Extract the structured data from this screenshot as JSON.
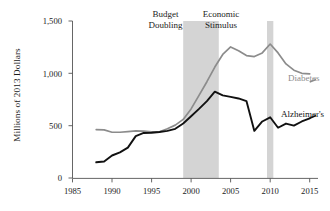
{
  "chart_data": {
    "type": "line",
    "title": "",
    "xlabel": "",
    "ylabel": "Millions of 2013 Dollars",
    "xlim": [
      1985,
      2016
    ],
    "ylim": [
      0,
      1500
    ],
    "grid": false,
    "legend_position": "right-inline-labels",
    "xticks": [
      1985,
      1990,
      1995,
      2000,
      2005,
      2010,
      2015
    ],
    "xtick_labels": [
      "1985",
      "1990",
      "1995",
      "2000",
      "2005",
      "2010",
      "2015"
    ],
    "yticks": [
      0,
      500,
      1000,
      1500
    ],
    "ytick_labels": [
      "0",
      "500",
      "1,000",
      "1,500"
    ],
    "series": [
      {
        "name": "Diabetes",
        "color": "#8c8c8c",
        "label_text": "Diabetes",
        "x": [
          1988,
          1989,
          1990,
          1991,
          1992,
          1993,
          1994,
          1995,
          1996,
          1997,
          1998,
          1999,
          2000,
          2001,
          2002,
          2003,
          2004,
          2005,
          2006,
          2007,
          2008,
          2009,
          2010,
          2011,
          2012,
          2013,
          2014,
          2015
        ],
        "values": [
          462,
          460,
          437,
          437,
          443,
          450,
          447,
          440,
          442,
          470,
          505,
          560,
          660,
          790,
          920,
          1060,
          1180,
          1252,
          1215,
          1170,
          1160,
          1195,
          1280,
          1195,
          1090,
          1030,
          1000,
          995
        ]
      },
      {
        "name": "Alzheimer's",
        "color": "#111111",
        "label_text": "Alzheimer's",
        "x": [
          1988,
          1989,
          1990,
          1991,
          1992,
          1993,
          1994,
          1995,
          1996,
          1997,
          1998,
          1999,
          2000,
          2001,
          2002,
          2003,
          2004,
          2005,
          2006,
          2007,
          2008,
          2009,
          2010,
          2011,
          2012,
          2013,
          2014,
          2015
        ],
        "values": [
          150,
          158,
          215,
          245,
          290,
          400,
          430,
          432,
          440,
          450,
          470,
          520,
          590,
          660,
          735,
          825,
          790,
          775,
          760,
          735,
          450,
          540,
          580,
          480,
          520,
          500,
          540,
          570
        ]
      }
    ],
    "annotations": [
      {
        "id": "budget-doubling",
        "text_line1": "Budget",
        "text_line2": "Doubling",
        "band_start": 1999.0,
        "band_end": 2003.5,
        "band_color": "#d4d4d4"
      },
      {
        "id": "economic-stimulus",
        "text_line1": "Economic",
        "text_line2": "Stimulus",
        "band_start": 2009.6,
        "band_end": 2010.4,
        "band_color": "#d4d4d4"
      }
    ]
  }
}
